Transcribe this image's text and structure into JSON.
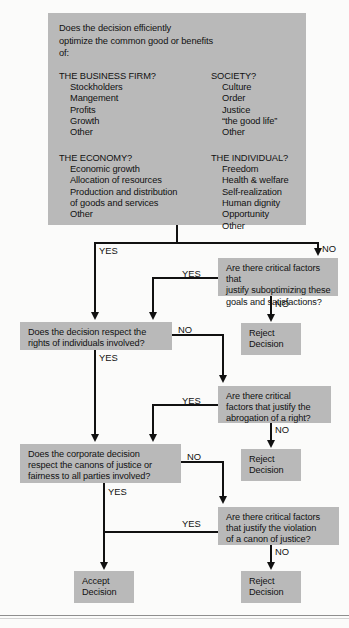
{
  "diagram": {
    "colors": {
      "box_fill": "#b9b9b9",
      "line": "#111111",
      "page_background": "#fbfbfa",
      "text": "#111111"
    },
    "top_box": {
      "intro": "Does the decision efficiently\noptimize the common good or benefits\nof:",
      "columns": [
        {
          "groups": [
            {
              "heading": "THE BUSINESS FIRM?",
              "items": [
                "Stockholders",
                "Mangement",
                "Profits",
                "Growth",
                "Other"
              ]
            },
            {
              "heading": "THE ECONOMY?",
              "items": [
                "Economic growth",
                "Allocation of resources",
                "Production and distribution\n   of goods and services",
                "Other"
              ]
            }
          ]
        },
        {
          "groups": [
            {
              "heading": "SOCIETY?",
              "items": [
                "Culture",
                "Order",
                "Justice",
                "“the good life”",
                "Other"
              ]
            },
            {
              "heading": "THE INDIVIDUAL?",
              "items": [
                "Freedom",
                "Health & welfare",
                "Self-realization",
                "Human dignity",
                "Opportunity",
                "Other"
              ]
            }
          ]
        }
      ]
    },
    "nodes": {
      "q_suboptimize": "Are there critical factors that\njustify suboptimizing these\ngoals and satisfactions?",
      "q_rights": "Does the decision respect the\nrights of individuals involved?",
      "q_abrogation": "Are there critical\nfactors that justify the\nabrogation of a right?",
      "q_canons": "Does the corporate decision\nrespect the canons of justice or\nfairness to all parties involved?",
      "q_violation": "Are there critical factors\nthat justify the violation\nof a canon of justice?",
      "reject_1": "Reject\nDecision",
      "reject_2": "Reject\nDecision",
      "reject_3": "Reject\nDecision",
      "accept": "Accept\nDecision"
    },
    "edge_labels": {
      "yes_top_left": "YES",
      "no_top_right": "NO",
      "yes_subopt": "YES",
      "no_subopt": "NO",
      "yes_rights": "YES",
      "no_rights": "NO",
      "yes_abrog": "YES",
      "no_abrog": "NO",
      "yes_canons": "YES",
      "no_canons": "NO",
      "yes_violat": "YES",
      "no_violat": "NO"
    }
  }
}
